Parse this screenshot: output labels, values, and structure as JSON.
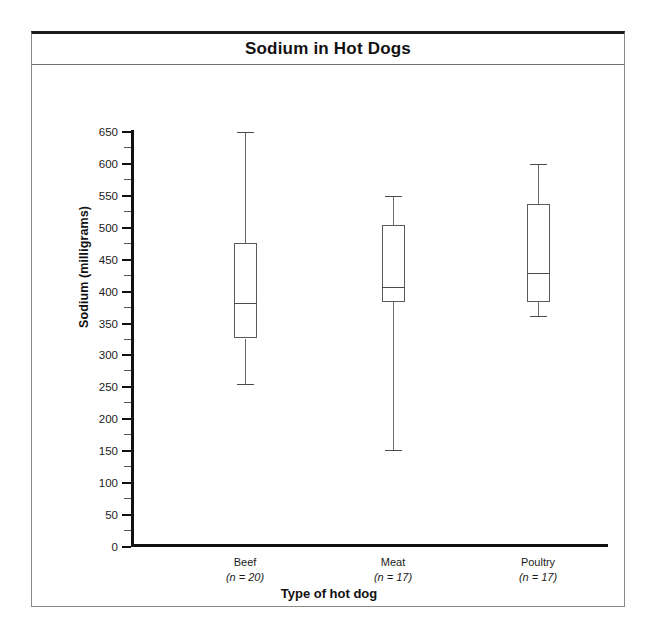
{
  "figure": {
    "title": "Sodium in Hot Dogs"
  },
  "axes": {
    "ylabel": "Sodium (milligrams)",
    "xlabel": "Type of hot dog",
    "ytick_labels": [
      "0",
      "50",
      "100",
      "150",
      "200",
      "250",
      "300",
      "350",
      "400",
      "450",
      "500",
      "550",
      "600",
      "650"
    ]
  },
  "categories": [
    {
      "name": "Beef",
      "n_text": "(n = 20)"
    },
    {
      "name": "Meat",
      "n_text": "(n = 17)"
    },
    {
      "name": "Poultry",
      "n_text": "(n = 17)"
    }
  ],
  "chart_data": {
    "type": "box",
    "title": "Sodium in Hot Dogs",
    "xlabel": "Type of hot dog",
    "ylabel": "Sodium (milligrams)",
    "categories": [
      "Beef",
      "Meat",
      "Poultry"
    ],
    "counts": [
      20,
      17,
      17
    ],
    "ylim": [
      0,
      650
    ],
    "ytick_major_step": 50,
    "ytick_minor_step": 25,
    "grid": false,
    "legend": "none",
    "series": [
      {
        "name": "Beef",
        "n": 20,
        "min": 253,
        "q1": 325,
        "median": 380,
        "q3": 475,
        "max": 648
      },
      {
        "name": "Meat",
        "n": 17,
        "min": 150,
        "q1": 382,
        "median": 405,
        "q3": 503,
        "max": 548
      },
      {
        "name": "Poultry",
        "n": 17,
        "min": 360,
        "q1": 382,
        "median": 428,
        "q3": 535,
        "max": 598
      }
    ]
  },
  "colors": {
    "frame": "#8a8a8a",
    "frame_top": "#1a1a1a",
    "axis": "#111111",
    "box_stroke": "#5a5a5a",
    "background": "#ffffff"
  }
}
